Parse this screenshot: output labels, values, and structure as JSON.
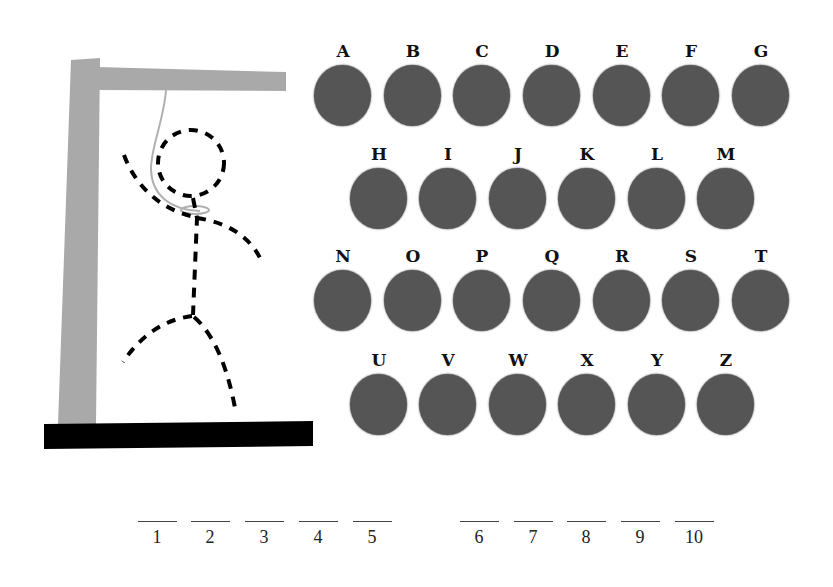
{
  "game": "Hangman",
  "colors": {
    "gallows_post": "#a9a9a9",
    "gallows_base": "#000000",
    "rope": "#b0b0b0",
    "figure": "#000000",
    "letter_oval": "#555555",
    "letter_text": "#111111"
  },
  "letters": [
    {
      "label": "A",
      "x": 314,
      "y": 43
    },
    {
      "label": "B",
      "x": 384,
      "y": 43
    },
    {
      "label": "C",
      "x": 453,
      "y": 43
    },
    {
      "label": "D",
      "x": 523,
      "y": 43
    },
    {
      "label": "E",
      "x": 593,
      "y": 43
    },
    {
      "label": "F",
      "x": 662,
      "y": 43
    },
    {
      "label": "G",
      "x": 732,
      "y": 43
    },
    {
      "label": "H",
      "x": 350,
      "y": 146
    },
    {
      "label": "I",
      "x": 419,
      "y": 146
    },
    {
      "label": "J",
      "x": 489,
      "y": 146
    },
    {
      "label": "K",
      "x": 558,
      "y": 146
    },
    {
      "label": "L",
      "x": 628,
      "y": 146
    },
    {
      "label": "M",
      "x": 697,
      "y": 146
    },
    {
      "label": "N",
      "x": 314,
      "y": 248
    },
    {
      "label": "O",
      "x": 384,
      "y": 248
    },
    {
      "label": "P",
      "x": 453,
      "y": 248
    },
    {
      "label": "Q",
      "x": 523,
      "y": 248
    },
    {
      "label": "R",
      "x": 593,
      "y": 248
    },
    {
      "label": "S",
      "x": 662,
      "y": 248
    },
    {
      "label": "T",
      "x": 732,
      "y": 248
    },
    {
      "label": "U",
      "x": 350,
      "y": 352
    },
    {
      "label": "V",
      "x": 419,
      "y": 352
    },
    {
      "label": "W",
      "x": 489,
      "y": 352
    },
    {
      "label": "X",
      "x": 558,
      "y": 352
    },
    {
      "label": "Y",
      "x": 628,
      "y": 352
    },
    {
      "label": "Z",
      "x": 697,
      "y": 352
    }
  ],
  "word_slots": [
    {
      "number": "1",
      "x": 137
    },
    {
      "number": "2",
      "x": 190
    },
    {
      "number": "3",
      "x": 244
    },
    {
      "number": "4",
      "x": 298
    },
    {
      "number": "5",
      "x": 352
    },
    {
      "number": "6",
      "x": 459
    },
    {
      "number": "7",
      "x": 513
    },
    {
      "number": "8",
      "x": 566
    },
    {
      "number": "9",
      "x": 620
    },
    {
      "number": "10",
      "x": 674
    }
  ]
}
